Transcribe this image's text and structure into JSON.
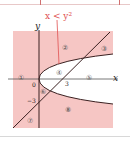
{
  "diagram": {
    "annotation": "x < y²",
    "annotation_color": "#e05050",
    "shade_color": "#f6c6c4",
    "curve_color": "#3a2020",
    "axis_labels": {
      "x": "x",
      "y": "y"
    },
    "ticks": {
      "origin": "0",
      "x3": "3",
      "ym3": "−3"
    },
    "regions": [
      {
        "id": "1",
        "label": "①"
      },
      {
        "id": "2",
        "label": "②"
      },
      {
        "id": "3",
        "label": "③"
      },
      {
        "id": "4",
        "label": "④"
      },
      {
        "id": "5",
        "label": "⑤"
      },
      {
        "id": "6",
        "label": "⑥"
      },
      {
        "id": "7",
        "label": "⑦"
      },
      {
        "id": "8",
        "label": "⑧"
      }
    ],
    "curves": [
      {
        "name": "parabola",
        "equation": "x = y²"
      },
      {
        "name": "line",
        "equation": "y = x − 3"
      }
    ]
  }
}
